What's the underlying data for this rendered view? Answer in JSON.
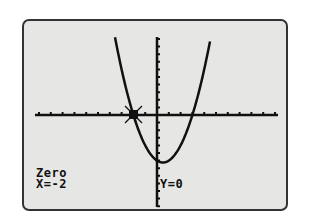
{
  "calculator": {
    "mode_label": "Zero",
    "x_readout": "X=-2",
    "y_readout": "Y=0"
  },
  "graph": {
    "function": "y = x^2 - x - 6",
    "zero_x": -2,
    "colors": {
      "screen": "#e6e6e4",
      "ink": "#111111",
      "border": "#333333"
    }
  }
}
